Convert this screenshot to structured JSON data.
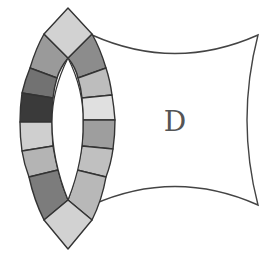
{
  "diagram": {
    "label": "D",
    "colors": {
      "stroke": "#333333",
      "background": "#ffffff",
      "label": "#555555"
    },
    "shapes": {
      "concave_patch": {
        "name": "D",
        "fill": "#ffffff"
      },
      "top_diamond": {
        "fill": "#d2d2d2"
      },
      "bottom_diamond": {
        "fill": "#d2d2d2"
      },
      "left_band": [
        {
          "fill": "#9a9a9a"
        },
        {
          "fill": "#727272"
        },
        {
          "fill": "#3a3a3a"
        },
        {
          "fill": "#cfcfcf"
        },
        {
          "fill": "#b4b4b4"
        },
        {
          "fill": "#7c7c7c"
        }
      ],
      "right_band": [
        {
          "fill": "#8c8c8c"
        },
        {
          "fill": "#bdbdbd"
        },
        {
          "fill": "#e0e0e0"
        },
        {
          "fill": "#9e9e9e"
        },
        {
          "fill": "#c0c0c0"
        },
        {
          "fill": "#b8b8b8"
        }
      ]
    }
  }
}
